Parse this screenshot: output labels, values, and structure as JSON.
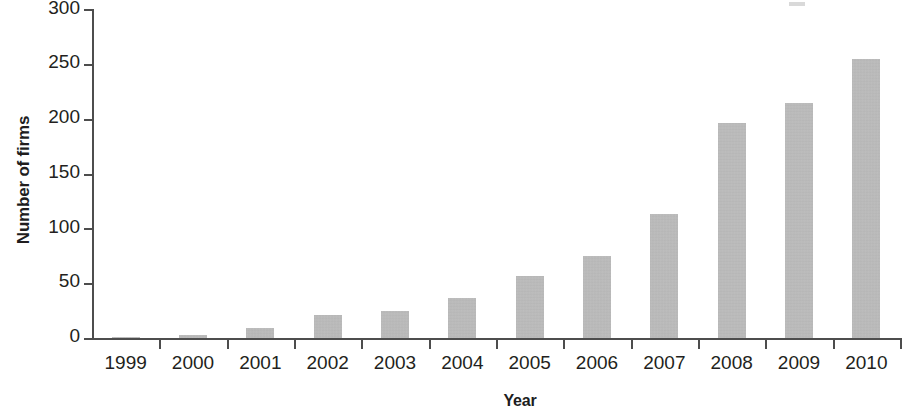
{
  "chart_data": {
    "type": "bar",
    "title": "",
    "subtitle": "",
    "xlabel": "Year",
    "ylabel": "Number of firms",
    "categories": [
      "1999",
      "2000",
      "2001",
      "2002",
      "2003",
      "2004",
      "2005",
      "2006",
      "2007",
      "2008",
      "2009",
      "2010"
    ],
    "values": [
      1,
      3,
      9,
      21,
      25,
      37,
      57,
      75,
      113,
      197,
      215,
      255
    ],
    "ylim": [
      0,
      300
    ],
    "ytick_labels": [
      "0",
      "50",
      "100",
      "150",
      "200",
      "250",
      "300"
    ],
    "ytick_values": [
      0,
      50,
      100,
      150,
      200,
      250,
      300
    ],
    "grid": false,
    "legend": "none",
    "bar_color": "#b3b3b3",
    "axis_color": "#4d4d4d",
    "text_color": "#231f20"
  }
}
